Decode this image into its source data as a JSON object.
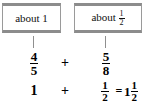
{
  "diagram": {
    "callouts": [
      {
        "prefix": "about ",
        "value_whole": "1",
        "value_num": "",
        "value_den": ""
      },
      {
        "prefix": "about ",
        "value_whole": "",
        "value_num": "1",
        "value_den": "2"
      }
    ],
    "row_estimate": {
      "left_fraction": {
        "numerator": "4",
        "denominator": "5"
      },
      "operator": "+",
      "right_fraction": {
        "numerator": "5",
        "denominator": "8"
      }
    },
    "row_result": {
      "left_value": "1",
      "operator": "+",
      "right_fraction": {
        "numerator": "1",
        "denominator": "2"
      },
      "equals": "=",
      "result": {
        "whole": "1",
        "numerator": "1",
        "denominator": "2"
      }
    },
    "colors": {
      "box_border": "#9a9a9a",
      "box_shadow_band": "#8c8c8c",
      "stem": "#8f8f8f",
      "text": "#111111",
      "math_text": "#000000",
      "background": "#ffffff"
    }
  }
}
